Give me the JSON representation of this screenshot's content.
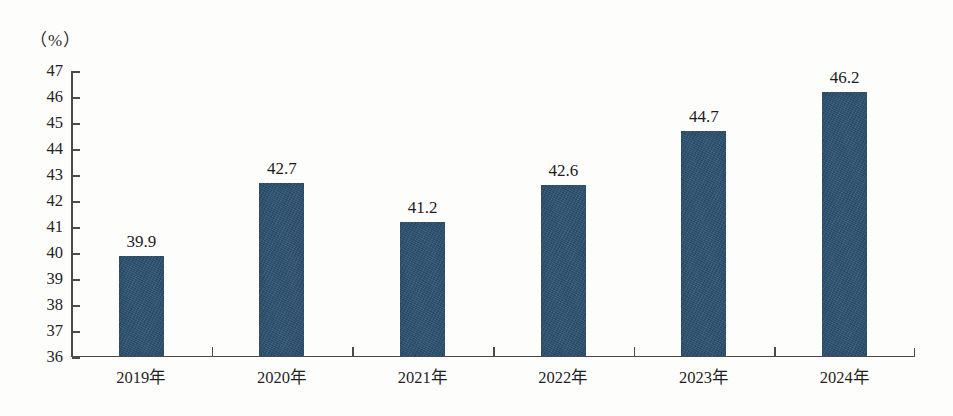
{
  "chart_data": {
    "type": "bar",
    "title": "",
    "subtitle": "",
    "xlabel": "",
    "ylabel": "（%）",
    "unit_label": "（%）",
    "categories": [
      "2019年",
      "2020年",
      "2021年",
      "2022年",
      "2023年",
      "2024年"
    ],
    "values": [
      39.9,
      42.7,
      41.2,
      42.6,
      44.7,
      46.2
    ],
    "value_labels": [
      "39.9",
      "42.7",
      "41.2",
      "42.6",
      "44.7",
      "46.2"
    ],
    "ylim": [
      36,
      47
    ],
    "ytick_labels": [
      "47",
      "46",
      "45",
      "44",
      "43",
      "42",
      "41",
      "40",
      "39",
      "38",
      "37",
      "36"
    ],
    "ytick_values": [
      47,
      46,
      45,
      44,
      43,
      42,
      41,
      40,
      39,
      38,
      37,
      36
    ],
    "ytick_step": 1,
    "grid": false,
    "legend": false,
    "legend_position": "none",
    "bar_color": "#2c5272",
    "axis_color": "#4a4a4a",
    "text_color": "#1c1c1c",
    "background_color": "#fdfdfc"
  }
}
